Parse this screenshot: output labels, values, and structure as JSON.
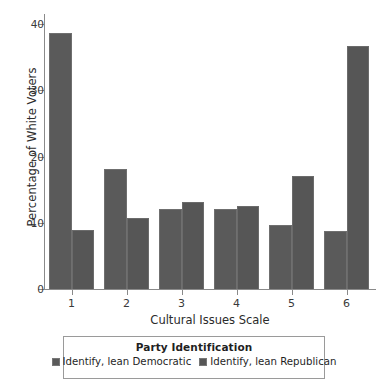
{
  "chart_data": {
    "type": "bar",
    "title": "",
    "xlabel": "Cultural Issues Scale",
    "ylabel": "Percentage of White Voters",
    "categories": [
      "1",
      "2",
      "3",
      "4",
      "5",
      "6"
    ],
    "ylim": [
      0,
      40
    ],
    "yticks": [
      0,
      10,
      20,
      30,
      40
    ],
    "ytick_labels": [
      "0",
      "10",
      "20",
      "30",
      "40"
    ],
    "grid": false,
    "legend_position": "bottom",
    "legend_title": "Party Identification",
    "series": [
      {
        "name": "Identify, lean Democratic",
        "color": "#5a5a5a",
        "values": [
          38.6,
          18.1,
          12.1,
          12.1,
          9.6,
          8.8
        ]
      },
      {
        "name": "Identify, lean Republican",
        "color": "#565656",
        "values": [
          8.9,
          10.8,
          13.2,
          12.6,
          17.0,
          36.7
        ]
      }
    ]
  },
  "legend": {
    "title": "Party Identification",
    "items": [
      {
        "label": "Identify, lean Democratic"
      },
      {
        "label": "Identify, lean Republican"
      }
    ]
  }
}
